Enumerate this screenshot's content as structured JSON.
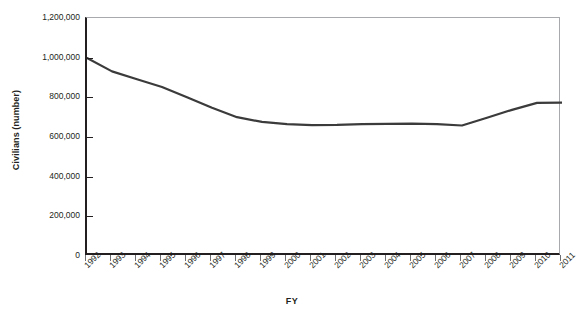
{
  "chart_data": {
    "type": "line",
    "title": "",
    "xlabel": "FY",
    "ylabel": "Civilians (number)",
    "categories": [
      "1992",
      "1993",
      "1994",
      "1995",
      "1996",
      "1997",
      "1998",
      "1999",
      "2000",
      "2001",
      "2002",
      "2003",
      "2004",
      "2005",
      "2006",
      "2007",
      "2008",
      "2009",
      "2010",
      "2011"
    ],
    "values": [
      998000,
      931000,
      891000,
      852000,
      800000,
      747000,
      700000,
      676000,
      665000,
      660000,
      661000,
      665000,
      666000,
      667000,
      665000,
      658000,
      697000,
      737000,
      772000,
      773000
    ],
    "ylim": [
      0,
      1200000
    ],
    "yticks": [
      0,
      200000,
      400000,
      600000,
      800000,
      1000000,
      1200000
    ],
    "ytick_labels": [
      "0",
      "200,000",
      "400,000",
      "600,000",
      "800,000",
      "1,000,000",
      "1,200,000"
    ],
    "grid": false,
    "legend": "none",
    "series_color": "#3b3b3b",
    "axis_color": "#231f20",
    "frame_color": "#a7a9ac",
    "background": "#ffffff"
  }
}
